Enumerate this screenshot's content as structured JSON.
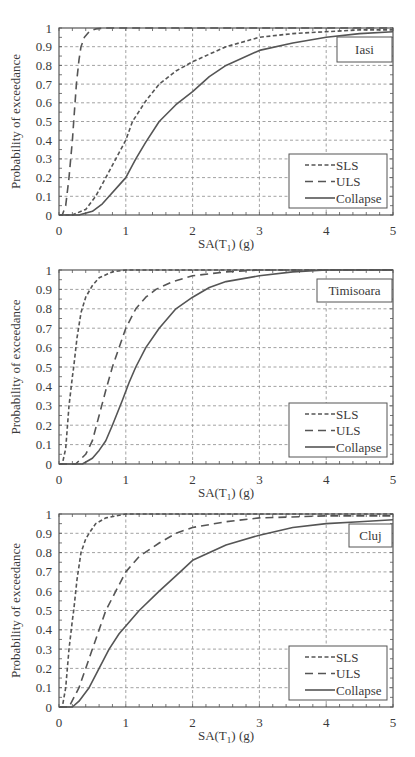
{
  "chart_data": [
    {
      "type": "line",
      "title": "Iasi",
      "xlabel": "SA(T1) (g)",
      "ylabel": "Probability of exceedance",
      "xlim": [
        0,
        5
      ],
      "ylim": [
        0,
        1
      ],
      "xticks": [
        "0",
        "1",
        "2",
        "3",
        "4",
        "5"
      ],
      "yticks": [
        "0",
        "0.1",
        "0.2",
        "0.3",
        "0.4",
        "0.5",
        "0.6",
        "0.7",
        "0.8",
        "0.9",
        "1"
      ],
      "grid": true,
      "legend_position": "lower right",
      "series": [
        {
          "name": "SLS",
          "style": "short-dash",
          "x": [
            0,
            0.2,
            0.4,
            0.55,
            0.7,
            0.85,
            1.0,
            1.1,
            1.3,
            1.5,
            1.75,
            2.0,
            2.5,
            3.0,
            3.5,
            4.0,
            4.5,
            5.0
          ],
          "y": [
            0,
            0.0,
            0.03,
            0.1,
            0.2,
            0.3,
            0.4,
            0.5,
            0.61,
            0.7,
            0.77,
            0.82,
            0.9,
            0.95,
            0.97,
            0.98,
            0.99,
            0.99
          ]
        },
        {
          "name": "ULS",
          "style": "long-dash",
          "x": [
            0,
            0.05,
            0.1,
            0.15,
            0.2,
            0.22,
            0.26,
            0.3,
            0.33,
            0.38,
            0.45,
            0.55,
            0.7,
            1.0,
            5.0
          ],
          "y": [
            0,
            0.0,
            0.05,
            0.2,
            0.4,
            0.5,
            0.7,
            0.83,
            0.9,
            0.95,
            0.98,
            0.995,
            1.0,
            1.0,
            1.0
          ]
        },
        {
          "name": "Collapse",
          "style": "solid",
          "x": [
            0,
            0.3,
            0.5,
            0.65,
            0.75,
            0.9,
            1.0,
            1.15,
            1.3,
            1.5,
            1.75,
            2.0,
            2.25,
            2.5,
            3.0,
            3.5,
            4.0,
            4.5,
            5.0
          ],
          "y": [
            0,
            0.0,
            0.02,
            0.06,
            0.1,
            0.16,
            0.2,
            0.3,
            0.39,
            0.5,
            0.59,
            0.66,
            0.74,
            0.8,
            0.88,
            0.92,
            0.95,
            0.97,
            0.98
          ]
        }
      ]
    },
    {
      "type": "line",
      "title": "Timisoara",
      "xlabel": "SA(T1) (g)",
      "ylabel": "Probability of exceedance",
      "xlim": [
        0,
        5
      ],
      "ylim": [
        0,
        1
      ],
      "xticks": [
        "0",
        "1",
        "2",
        "3",
        "4",
        "5"
      ],
      "yticks": [
        "0",
        "0.1",
        "0.2",
        "0.3",
        "0.4",
        "0.5",
        "0.6",
        "0.7",
        "0.8",
        "0.9",
        "1"
      ],
      "grid": true,
      "legend_position": "lower right",
      "series": [
        {
          "name": "SLS",
          "style": "short-dash",
          "x": [
            0,
            0.05,
            0.1,
            0.15,
            0.2,
            0.22,
            0.27,
            0.33,
            0.4,
            0.5,
            0.6,
            0.8,
            1.0,
            5.0
          ],
          "y": [
            0,
            0.0,
            0.08,
            0.3,
            0.45,
            0.5,
            0.65,
            0.78,
            0.86,
            0.92,
            0.96,
            0.99,
            1.0,
            1.0
          ]
        },
        {
          "name": "ULS",
          "style": "long-dash",
          "x": [
            0,
            0.25,
            0.4,
            0.5,
            0.6,
            0.7,
            0.8,
            0.9,
            1.0,
            1.15,
            1.3,
            1.45,
            1.7,
            2.0,
            2.5,
            3.0,
            5.0
          ],
          "y": [
            0,
            0.0,
            0.05,
            0.12,
            0.25,
            0.38,
            0.5,
            0.6,
            0.7,
            0.8,
            0.86,
            0.9,
            0.94,
            0.97,
            0.99,
            1.0,
            1.0
          ]
        },
        {
          "name": "Collapse",
          "style": "solid",
          "x": [
            0,
            0.35,
            0.5,
            0.6,
            0.7,
            0.8,
            0.95,
            1.05,
            1.15,
            1.3,
            1.5,
            1.75,
            2.0,
            2.25,
            2.5,
            3.0,
            3.5,
            4.0,
            5.0
          ],
          "y": [
            0,
            0.0,
            0.03,
            0.07,
            0.12,
            0.2,
            0.33,
            0.42,
            0.5,
            0.6,
            0.7,
            0.8,
            0.86,
            0.91,
            0.94,
            0.97,
            0.99,
            1.0,
            1.0
          ]
        }
      ]
    },
    {
      "type": "line",
      "title": "Cluj",
      "xlabel": "SA(T1) (g)",
      "ylabel": "Probability of exceedance",
      "xlim": [
        0,
        5
      ],
      "ylim": [
        0,
        1
      ],
      "xticks": [
        "0",
        "1",
        "2",
        "3",
        "4",
        "5"
      ],
      "yticks": [
        "0",
        "0.1",
        "0.2",
        "0.3",
        "0.4",
        "0.5",
        "0.6",
        "0.7",
        "0.8",
        "0.9",
        "1"
      ],
      "grid": true,
      "legend_position": "lower right",
      "series": [
        {
          "name": "SLS",
          "style": "short-dash",
          "x": [
            0,
            0.05,
            0.1,
            0.15,
            0.2,
            0.22,
            0.27,
            0.33,
            0.4,
            0.45,
            0.55,
            0.7,
            1.0,
            5.0
          ],
          "y": [
            0,
            0.0,
            0.1,
            0.3,
            0.45,
            0.5,
            0.66,
            0.8,
            0.87,
            0.9,
            0.95,
            0.98,
            1.0,
            1.0
          ]
        },
        {
          "name": "ULS",
          "style": "long-dash",
          "x": [
            0,
            0.15,
            0.3,
            0.4,
            0.5,
            0.6,
            0.7,
            0.85,
            1.0,
            1.2,
            1.5,
            1.75,
            2.0,
            2.5,
            3.0,
            4.0,
            5.0
          ],
          "y": [
            0,
            0.0,
            0.1,
            0.2,
            0.3,
            0.4,
            0.5,
            0.6,
            0.7,
            0.78,
            0.85,
            0.9,
            0.93,
            0.96,
            0.98,
            0.99,
            0.99
          ]
        },
        {
          "name": "Collapse",
          "style": "solid",
          "x": [
            0,
            0.2,
            0.3,
            0.45,
            0.6,
            0.75,
            0.9,
            1.0,
            1.2,
            1.5,
            1.75,
            2.0,
            2.5,
            3.0,
            3.5,
            4.0,
            4.5,
            5.0
          ],
          "y": [
            0,
            0.0,
            0.03,
            0.1,
            0.2,
            0.3,
            0.38,
            0.42,
            0.5,
            0.6,
            0.68,
            0.76,
            0.84,
            0.89,
            0.93,
            0.95,
            0.96,
            0.97
          ]
        }
      ]
    }
  ],
  "charts_layout": [
    {
      "top": 0,
      "plot": {
        "x0": 59,
        "x1": 393,
        "y0": 28,
        "y1": 215
      },
      "station_label_box": [
        337,
        37,
        392,
        62
      ]
    },
    {
      "top": 0,
      "plot": {
        "x0": 59,
        "x1": 393,
        "y0": 270,
        "y1": 464
      },
      "station_label_box": [
        317,
        279,
        392,
        302
      ]
    },
    {
      "top": 0,
      "plot": {
        "x0": 59,
        "x1": 393,
        "y0": 514,
        "y1": 707
      },
      "station_label_box": [
        349,
        524,
        392,
        547
      ]
    }
  ],
  "style": {
    "axis_color": "#555555",
    "grid_color": "#8a8a8a",
    "line_color": "#555555",
    "background": "#ffffff"
  }
}
